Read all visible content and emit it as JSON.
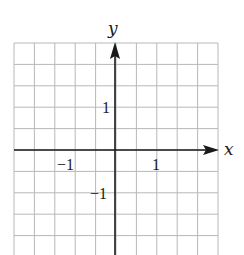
{
  "chart_data": {
    "type": "coordinate-grid",
    "title": "",
    "xlabel": "x",
    "ylabel": "y",
    "grid": true,
    "grid_step": 0.5,
    "xlim": [
      -2.5,
      2.5
    ],
    "ylim": [
      -2.5,
      2.5
    ],
    "x_ticks_labeled": [
      {
        "value": -1,
        "label": "−1"
      },
      {
        "value": 1,
        "label": "1"
      }
    ],
    "y_ticks_labeled": [
      {
        "value": 1,
        "label": "1"
      },
      {
        "value": -1,
        "label": "−1"
      }
    ],
    "axis_arrows": [
      "positive-x",
      "positive-y"
    ],
    "series": []
  },
  "labels": {
    "x_axis": "x",
    "y_axis": "y",
    "x_tick_neg1": "−1",
    "x_tick_pos1": "1",
    "y_tick_pos1": "1",
    "y_tick_neg1": "−1"
  },
  "colors": {
    "grid": "#b8b8b8",
    "axis": "#1a1a1a",
    "background": "#ffffff"
  }
}
